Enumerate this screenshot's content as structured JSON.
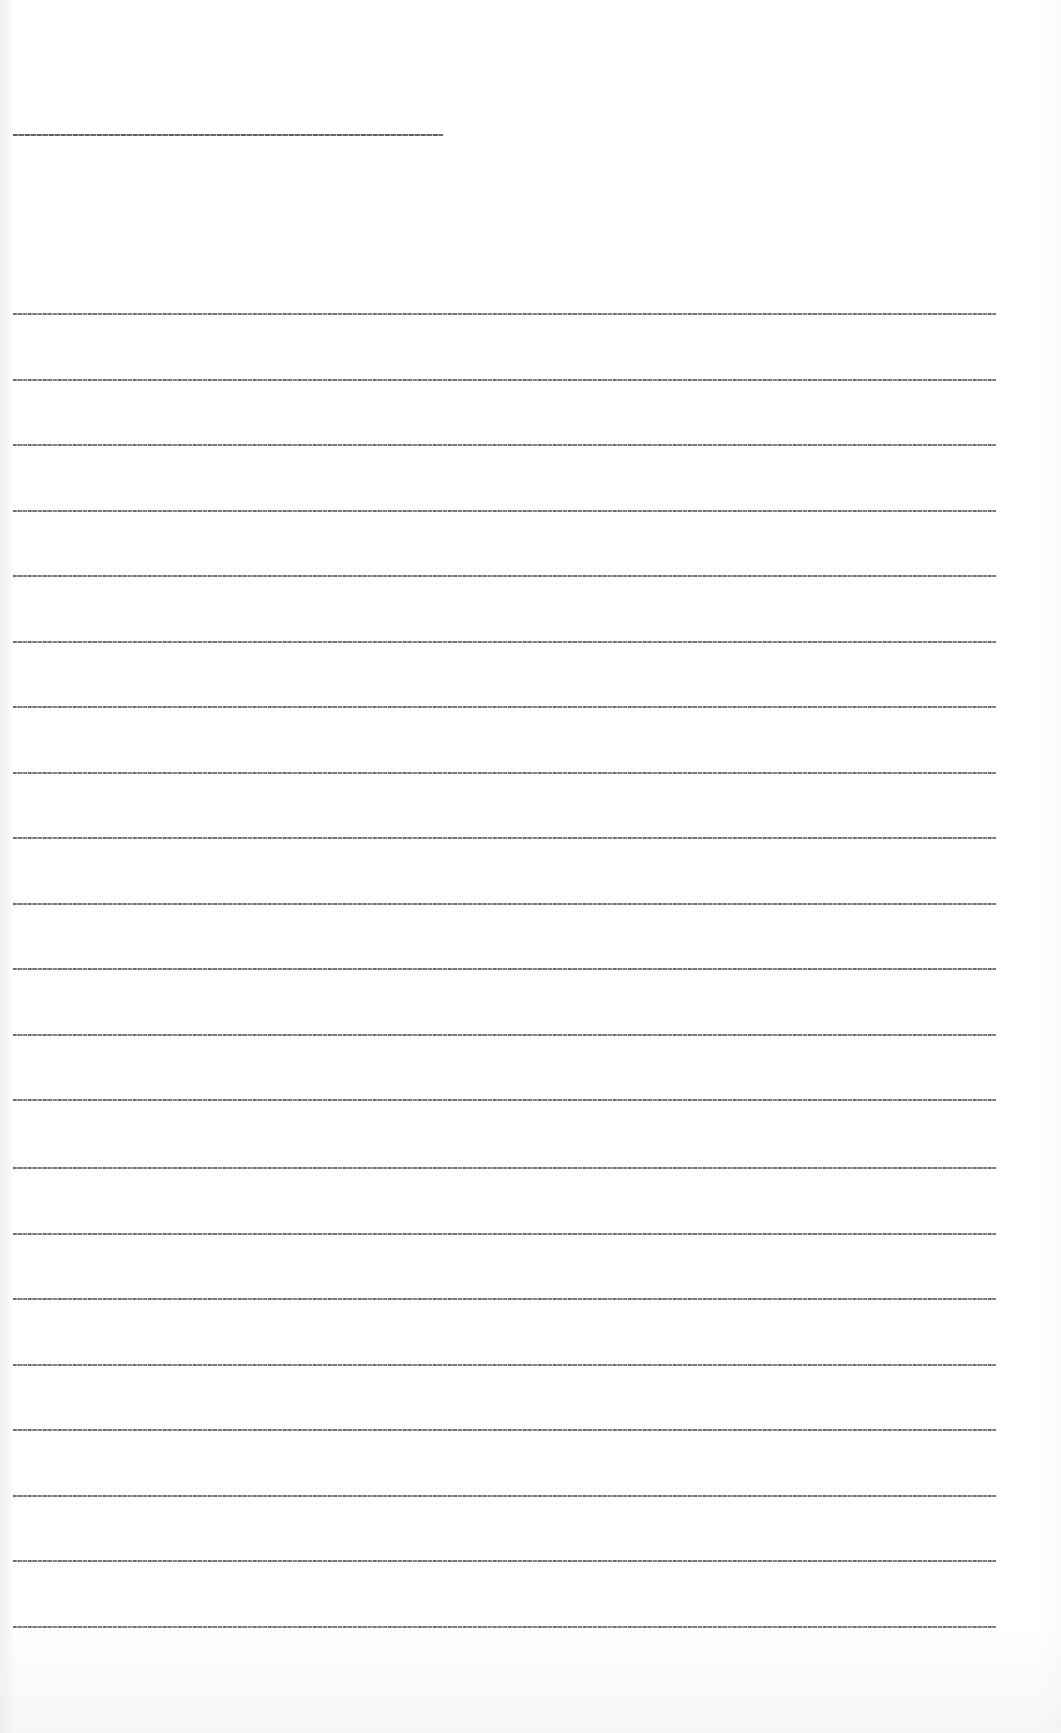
{
  "document": {
    "title_line": {
      "text": "[illegible title text]",
      "legible": false
    },
    "body_lines": [
      {
        "text": "[illegible text line 1]"
      },
      {
        "text": "[illegible text line 2]"
      },
      {
        "text": "[illegible text line 3]"
      },
      {
        "text": "[illegible text line 4]"
      },
      {
        "text": "[illegible text line 5]"
      },
      {
        "text": "[illegible text line 6]"
      },
      {
        "text": "[illegible text line 7]"
      },
      {
        "text": "[illegible text line 8]"
      },
      {
        "text": "[illegible text line 9]"
      },
      {
        "text": "[illegible text line 10]"
      },
      {
        "text": "[illegible text line 11]"
      },
      {
        "text": "[illegible text line 12]"
      },
      {
        "text": "[illegible text line 13]"
      },
      {
        "text": "[illegible text line 14]"
      },
      {
        "text": "[illegible text line 15]"
      },
      {
        "text": "[illegible text line 16]"
      },
      {
        "text": "[illegible text line 17]"
      },
      {
        "text": "[illegible text line 18]"
      },
      {
        "text": "[illegible text line 19]"
      },
      {
        "text": "[illegible text line 20]"
      },
      {
        "text": "[illegible text line 21]"
      }
    ],
    "line_count": 21
  }
}
